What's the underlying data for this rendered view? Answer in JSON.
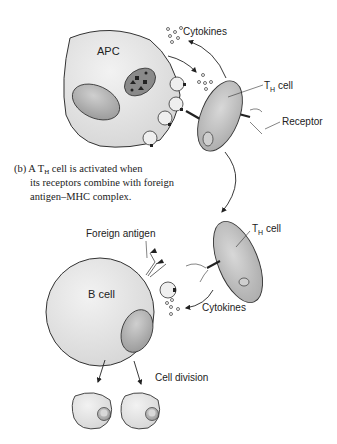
{
  "labels": {
    "apc": "APC",
    "cytokines_top": "Cytokines",
    "th_cell_top": "T",
    "th_cell_top_sub": "H",
    "th_cell_top_suffix": " cell",
    "receptor": "Receptor",
    "foreign_antigen": "Foreign antigen",
    "th_cell_bottom": "T",
    "th_cell_bottom_sub": "H",
    "th_cell_bottom_suffix": " cell",
    "b_cell": "B cell",
    "cytokines_bottom": "Cytokines",
    "cell_division": "Cell division"
  },
  "caption": {
    "part": "(b)",
    "line1_a": "A T",
    "line1_sub": "H",
    "line1_b": " cell is activated when",
    "line2": "its receptors combine with foreign",
    "line3": "antigen–MHC complex."
  },
  "colors": {
    "cell_fill": "#e4e4e4",
    "nucleus_fill": "#b8b8b8",
    "outline": "#333333"
  }
}
